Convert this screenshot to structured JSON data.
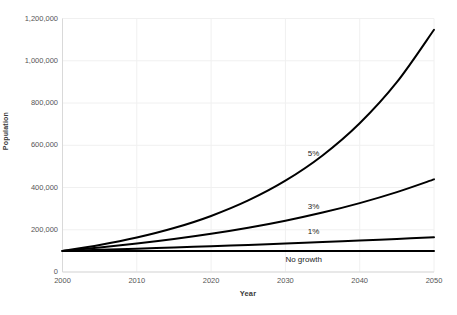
{
  "chart_data": {
    "type": "line",
    "title": "",
    "xlabel": "Year",
    "ylabel": "Population",
    "xlim": [
      2000,
      2050
    ],
    "ylim": [
      0,
      1200000
    ],
    "grid": true,
    "legend_position": "inline-annotations",
    "x_tick_labels": [
      "2000",
      "2010",
      "2020",
      "2030",
      "2040",
      "2050"
    ],
    "x_ticks": [
      2000,
      2010,
      2020,
      2030,
      2040,
      2050
    ],
    "y_tick_labels": [
      "0",
      "200,000",
      "400,000",
      "600,000",
      "800,000",
      "1,000,000",
      "1,200,000"
    ],
    "y_ticks": [
      0,
      200000,
      400000,
      600000,
      800000,
      1000000,
      1200000
    ],
    "x": [
      2000,
      2005,
      2010,
      2015,
      2020,
      2025,
      2030,
      2035,
      2040,
      2045,
      2050
    ],
    "series": [
      {
        "name": "5%",
        "label": "5%",
        "color": "#000000",
        "values": [
          100000,
          127628,
          162889,
          207893,
          265330,
          338635,
          432194,
          551602,
          704000,
          898501,
          1146740
        ]
      },
      {
        "name": "3%",
        "label": "3%",
        "color": "#000000",
        "values": [
          100000,
          115927,
          134392,
          155797,
          180611,
          209378,
          242726,
          281386,
          326204,
          378160,
          438391
        ]
      },
      {
        "name": "1%",
        "label": "1%",
        "color": "#000000",
        "values": [
          100000,
          105101,
          110462,
          116097,
          122019,
          128243,
          134785,
          141660,
          148886,
          156481,
          164463
        ]
      },
      {
        "name": "No growth",
        "label": "No growth",
        "color": "#000000",
        "values": [
          100000,
          100000,
          100000,
          100000,
          100000,
          100000,
          100000,
          100000,
          100000,
          100000,
          100000
        ]
      }
    ],
    "annotations": [
      {
        "text": "5%",
        "x": 2033,
        "y": 560000
      },
      {
        "text": "3%",
        "x": 2033,
        "y": 310000
      },
      {
        "text": "1%",
        "x": 2033,
        "y": 190000
      },
      {
        "text": "No growth",
        "x": 2030,
        "y": 55000
      }
    ]
  },
  "colors": {
    "line": "#000000",
    "grid": "#f0f0f0",
    "axis": "#d9d9d9",
    "text": "#555555",
    "title_text": "#3a3a3a",
    "background": "#ffffff"
  }
}
